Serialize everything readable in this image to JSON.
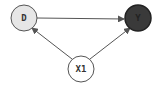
{
  "diagram": {
    "type": "causal-dag",
    "nodes": [
      {
        "id": "D",
        "label": "D",
        "cx": 24,
        "cy": 18,
        "r": 13,
        "fill": "#e6e6e6",
        "text_color": "#333333"
      },
      {
        "id": "Y",
        "label": "Y",
        "cx": 138,
        "cy": 18,
        "r": 13,
        "fill": "#3a3a3a",
        "text_color": "#222222"
      },
      {
        "id": "X1",
        "label": "X1",
        "cx": 81,
        "cy": 69,
        "r": 13,
        "fill": "#ffffff",
        "text_color": "#333333"
      }
    ],
    "edges": [
      {
        "from": "D",
        "to": "Y"
      },
      {
        "from": "X1",
        "to": "D"
      },
      {
        "from": "X1",
        "to": "Y"
      }
    ],
    "stroke_color": "#555555"
  }
}
